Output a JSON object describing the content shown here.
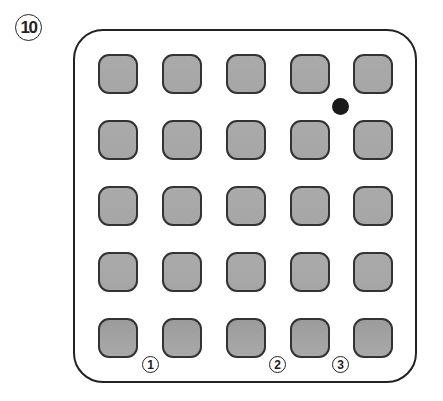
{
  "figure": {
    "label": "10",
    "grid": {
      "rows": 5,
      "cols": 5
    },
    "colors": {
      "cell_fill": "#a8a8a8",
      "cell_border": "#333333",
      "frame": "#222222",
      "dot": "#1a1a1a"
    },
    "dot": {
      "between_row": 1,
      "between_col": 4
    },
    "markers": [
      {
        "label": "1",
        "position": "below row 5, between col 1 and col 2"
      },
      {
        "label": "2",
        "position": "below row 5, between col 3 and col 4"
      },
      {
        "label": "3",
        "position": "below row 5, between col 4 and col 5"
      }
    ]
  }
}
